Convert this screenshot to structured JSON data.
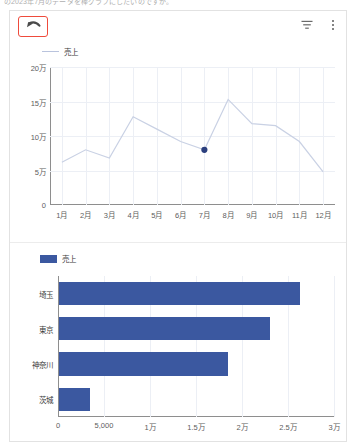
{
  "page": {
    "clipped_heading": "の2023年7月のデータを棒グラフにしたいのですが。"
  },
  "toolbar": {
    "undo_label": "undo-arrow",
    "filter_label": "filter",
    "menu_label": "more-options",
    "highlight_color": "#ef4b3c"
  },
  "colors": {
    "bar": "#3b58a0",
    "line": "#c9d1e4",
    "point": "#2b3f7e",
    "grid": "#eceff5",
    "axis": "#8e8e8e"
  },
  "chart_data": [
    {
      "type": "line",
      "title": "",
      "legend": [
        "売上"
      ],
      "legend_position": "top-left",
      "xlabel": "",
      "ylabel": "",
      "categories": [
        "1月",
        "2月",
        "3月",
        "4月",
        "5月",
        "6月",
        "7月",
        "8月",
        "9月",
        "10月",
        "11月",
        "12月"
      ],
      "x_tick_labels": [
        "1月",
        "2月",
        "3月",
        "4月",
        "5月",
        "6月",
        "7月",
        "8月",
        "9月",
        "10月",
        "11月",
        "12月"
      ],
      "y_tick_labels": [
        "0",
        "5万",
        "10万",
        "15万",
        "20万"
      ],
      "y_tick_values": [
        0,
        50000,
        100000,
        150000,
        200000
      ],
      "ylim": [
        0,
        200000
      ],
      "grid": true,
      "series": [
        {
          "name": "売上",
          "values": [
            62000,
            80000,
            68000,
            128000,
            110000,
            92000,
            80000,
            153000,
            118000,
            115000,
            92000,
            48000
          ]
        }
      ],
      "highlighted_point": {
        "category": "7月",
        "value": 80000
      }
    },
    {
      "type": "bar",
      "orientation": "horizontal",
      "title": "",
      "legend": [
        "売上"
      ],
      "legend_position": "top-left",
      "xlabel": "",
      "ylabel": "",
      "categories": [
        "埼玉",
        "東京",
        "神奈川",
        "茨城"
      ],
      "x_tick_labels": [
        "0",
        "5,000",
        "1万",
        "1.5万",
        "2万",
        "2.5万",
        "3万"
      ],
      "x_tick_values": [
        0,
        5000,
        10000,
        15000,
        20000,
        25000,
        30000
      ],
      "xlim": [
        0,
        30000
      ],
      "grid": true,
      "series": [
        {
          "name": "売上",
          "values": [
            26200,
            22900,
            18400,
            3400
          ]
        }
      ]
    }
  ]
}
